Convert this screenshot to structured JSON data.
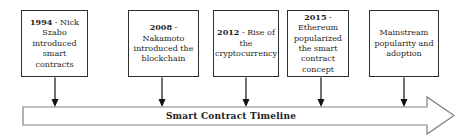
{
  "diagram": {
    "title": "Smart Contract Timeline",
    "boxes": [
      {
        "year": "1994",
        "rest": " - Nick Szabo introduced smart contracts"
      },
      {
        "year": "2008",
        "rest": " - Nakamoto introduced the blockchain"
      },
      {
        "year": "2012",
        "rest": " - Rise of the cryptocurrency"
      },
      {
        "year": "2015",
        "rest": " - Ethereum popularized the smart contract concept"
      },
      {
        "year": "",
        "rest": "Mainstream popularity and adoption"
      }
    ],
    "colors": {
      "box_border": "#2e2e2e",
      "connector": "#111111",
      "timeline_arrow_outline": "#7f7f7f",
      "text": "#1f1f1f",
      "background": "#ffffff"
    }
  }
}
